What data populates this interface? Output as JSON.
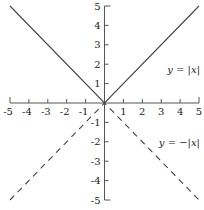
{
  "chart_data": {
    "type": "line",
    "title": "",
    "xlabel": "",
    "ylabel": "",
    "xlim": [
      -5,
      5
    ],
    "ylim": [
      -5,
      5
    ],
    "grid": false,
    "legend": "none",
    "x_ticks": [
      -5,
      -4,
      -3,
      -2,
      -1,
      1,
      2,
      3,
      4,
      5
    ],
    "y_ticks": [
      5,
      4,
      3,
      2,
      1,
      -1,
      -2,
      -3,
      -4,
      -5
    ],
    "series": [
      {
        "name": "y = |x|",
        "style": "solid",
        "color": "#444444",
        "x": [
          -5,
          0,
          5
        ],
        "y": [
          5,
          0,
          5
        ]
      },
      {
        "name": "y = −|x|",
        "style": "dashed",
        "color": "#444444",
        "x": [
          -5,
          0,
          5
        ],
        "y": [
          -5,
          0,
          -5
        ]
      }
    ],
    "annotations": [
      {
        "text": "y = |x|",
        "x": 4.2,
        "y": 1.6
      },
      {
        "text": "y = −|x|",
        "x": 4.2,
        "y": -1.6
      }
    ]
  },
  "labels": {
    "abs": "y = |x|",
    "negabs": "y = −|x|"
  }
}
